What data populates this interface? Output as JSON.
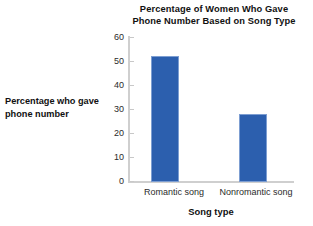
{
  "chart_data": {
    "type": "bar",
    "title": "Percentage of Women Who Gave Phone Number Based on Song Type",
    "title_lines": [
      "Percentage of Women Who Gave",
      "Phone Number Based on Song Type"
    ],
    "xlabel": "Song type",
    "ylabel": "Percentage who gave phone number",
    "ylabel_lines": [
      "Percentage who gave",
      "phone number"
    ],
    "categories": [
      "Romantic song",
      "Nonromantic song"
    ],
    "values": [
      52,
      28
    ],
    "ylim": [
      0,
      60
    ],
    "yticks": [
      0,
      10,
      20,
      30,
      40,
      50,
      60
    ],
    "ytick_labels": [
      "0",
      "10",
      "20",
      "30",
      "40",
      "50",
      "60"
    ],
    "grid": false,
    "legend": false,
    "bar_color": "#2c5fae",
    "bar_edge_color": "#7d9ed2",
    "axis_color": "#cfcfcf"
  }
}
